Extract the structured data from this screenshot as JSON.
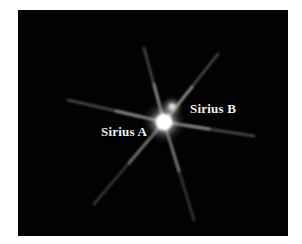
{
  "image": {
    "subject": "Sirius binary star system",
    "background_color": "#020202",
    "frame_color": "#ffffff"
  },
  "labels": {
    "sirius_a": "Sirius A",
    "sirius_b": "Sirius B"
  },
  "stars": [
    {
      "name": "Sirius A",
      "cx": 146,
      "cy": 112,
      "r_core": 7,
      "r_glow": 20,
      "color": "#ffffff"
    },
    {
      "name": "Sirius B",
      "cx": 154,
      "cy": 97,
      "r_core": 3,
      "r_glow": 9,
      "color": "#eeeeee"
    }
  ]
}
